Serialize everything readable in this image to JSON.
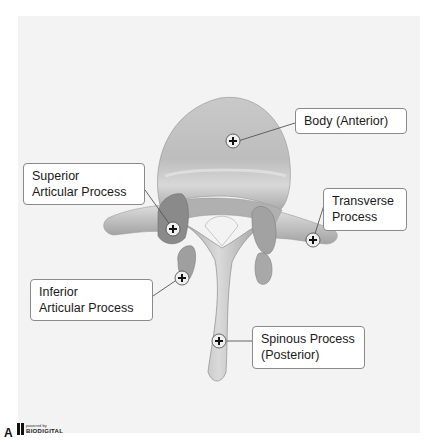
{
  "figure": {
    "letter": "A",
    "logo": {
      "small_text": "powered by",
      "brand": "BIODIGITAL"
    }
  },
  "labels": [
    {
      "id": "body",
      "lines": [
        "Body (Anterior)"
      ]
    },
    {
      "id": "superior-articular",
      "lines": [
        "Superior",
        "Articular Process"
      ]
    },
    {
      "id": "transverse",
      "lines": [
        "Transverse",
        "Process"
      ]
    },
    {
      "id": "inferior-articular",
      "lines": [
        "Inferior",
        "Articular Process"
      ]
    },
    {
      "id": "spinous",
      "lines": [
        "Spinous Process",
        "(Posterior)"
      ]
    }
  ],
  "colors": {
    "panel_bg": "#f3f3f3",
    "bone_light": "#d9d9d9",
    "bone_mid": "#b8b8b8",
    "bone_dark": "#8f8f8f",
    "facet": "#7d7d7d",
    "leader_line": "#555555",
    "marker_bg": "#efefef"
  }
}
